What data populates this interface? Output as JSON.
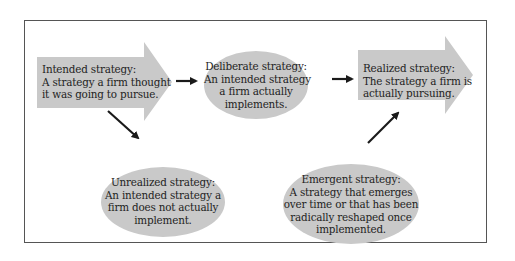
{
  "diagram": {
    "colors": {
      "shape_fill": "#c9c9c9",
      "arrow": "#1a1a1a",
      "frame_border": "#555555",
      "text": "#1e1e1e"
    },
    "nodes": [
      {
        "id": "intended",
        "shape": "block-arrow",
        "title": "Intended strategy:",
        "lines": [
          "A strategy a firm thought",
          "it was going to pursue."
        ]
      },
      {
        "id": "deliberate",
        "shape": "ellipse",
        "title": "Deliberate strategy:",
        "lines": [
          "An intended strategy",
          "a firm actually",
          "implements."
        ]
      },
      {
        "id": "realized",
        "shape": "block-arrow",
        "title": "Realized strategy:",
        "lines": [
          "The strategy a firm is",
          "actually pursuing."
        ]
      },
      {
        "id": "unrealized",
        "shape": "ellipse",
        "title": "Unrealized strategy:",
        "lines": [
          "An intended strategy a",
          "firm does not actually",
          "implement."
        ]
      },
      {
        "id": "emergent",
        "shape": "ellipse",
        "title": "Emergent strategy:",
        "lines": [
          "A strategy that emerges",
          "over time or that has been",
          "radically reshaped once",
          "implemented."
        ]
      }
    ],
    "edges": [
      {
        "from": "intended",
        "to": "deliberate"
      },
      {
        "from": "deliberate",
        "to": "realized"
      },
      {
        "from": "intended",
        "to": "unrealized"
      },
      {
        "from": "emergent",
        "to": "realized"
      }
    ]
  }
}
